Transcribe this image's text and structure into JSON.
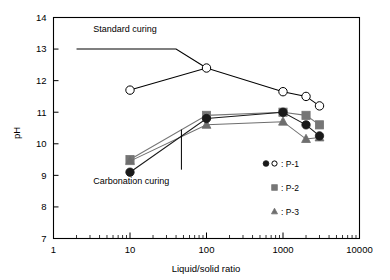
{
  "figure": {
    "title": "",
    "background_color": "#ffffff"
  },
  "chart_data": {
    "type": "line",
    "title": "",
    "xlabel": "Liquid/solid ratio",
    "ylabel": "pH",
    "xscale": "log",
    "yscale": "linear",
    "xlim": [
      1,
      10000
    ],
    "ylim": [
      7,
      14
    ],
    "xticks": [
      1,
      10,
      100,
      1000,
      10000
    ],
    "xticklabels": [
      "1",
      "10",
      "100",
      "1000",
      "10000"
    ],
    "yticks": [
      7,
      8,
      9,
      10,
      11,
      12,
      13,
      14
    ],
    "yticklabels": [
      "7",
      "8",
      "9",
      "10",
      "11",
      "12",
      "13",
      "14"
    ],
    "grid": false,
    "legend_position": "lower-right",
    "series": [
      {
        "name": "P-1 standard curing",
        "marker": "open-circle",
        "color": "#000000",
        "fill": "#ffffff",
        "group": "Standard curing",
        "x": [
          10,
          100,
          1000,
          2000,
          3000
        ],
        "y": [
          11.7,
          12.4,
          11.65,
          11.5,
          11.2
        ]
      },
      {
        "name": "P-1 carbonation curing",
        "marker": "filled-circle",
        "color": "#1a1a1a",
        "fill": "#1a1a1a",
        "group": "Carbonation curing",
        "x": [
          10,
          100,
          1000,
          2000,
          3000
        ],
        "y": [
          9.1,
          10.8,
          11.0,
          10.6,
          10.25
        ]
      },
      {
        "name": "P-2 carbonation curing",
        "marker": "filled-square",
        "color": "#767676",
        "fill": "#767676",
        "group": "Carbonation curing",
        "x": [
          10,
          100,
          1000,
          2000,
          3000
        ],
        "y": [
          9.5,
          10.9,
          11.0,
          10.9,
          10.6
        ]
      },
      {
        "name": "P-3 carbonation curing",
        "marker": "filled-triangle",
        "color": "#6e6e6e",
        "fill": "#6e6e6e",
        "group": "Carbonation curing",
        "x": [
          10,
          100,
          1000,
          2000,
          3000
        ],
        "y": [
          9.45,
          10.6,
          10.7,
          10.15,
          10.2
        ]
      }
    ],
    "reference_lines": [
      {
        "name": "standard-curing-plateau",
        "description": "horizontal line at pH 13 from ratio 2 to 40, joining to the 100 data point",
        "points": [
          [
            2,
            13.0
          ],
          [
            40,
            13.0
          ],
          [
            100,
            12.4
          ]
        ],
        "color": "#000000"
      }
    ],
    "annotations": [
      {
        "text": "Standard curing",
        "x": 3.3,
        "y": 13.55
      },
      {
        "text": "Carbonation curing",
        "x": 3.3,
        "y": 8.72
      },
      {
        "text": "",
        "x": 47,
        "y": 10.3,
        "kind": "leader-line-vertical"
      }
    ]
  },
  "legend": {
    "entries": [
      {
        "symbols": "filled-circle,open-circle",
        "separator": ":",
        "label": "P-1"
      },
      {
        "symbols": "filled-square",
        "separator": ":",
        "label": "P-2"
      },
      {
        "symbols": "filled-triangle",
        "separator": ":",
        "label": "P-3"
      }
    ],
    "items": [
      {
        "label": ": P-1"
      },
      {
        "label": ": P-2"
      },
      {
        "label": ": P-3"
      }
    ]
  },
  "axis": {
    "y_title": "pH",
    "x_title": "Liquid/solid ratio"
  },
  "labels": {
    "standard_curing": "Standard curing",
    "carbonation_curing": "Carbonation curing"
  },
  "colors": {
    "axis": "#000000",
    "p1": "#1a1a1a",
    "p2": "#767676",
    "p3": "#6e6e6e",
    "background": "#ffffff"
  }
}
